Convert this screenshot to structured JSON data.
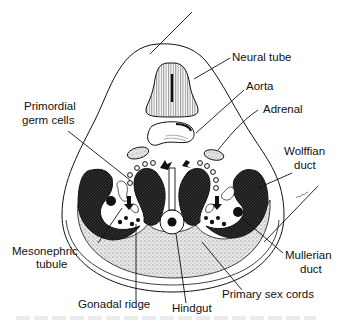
{
  "diagram": {
    "labels": {
      "neural_tube": "Neural tube",
      "aorta": "Aorta",
      "adrenal": "Adrenal",
      "primordial_germ_cells_1": "Primordial",
      "primordial_germ_cells_2": "germ cells",
      "wolffian_duct_1": "Wolffian",
      "wolffian_duct_2": "duct",
      "mesonephric_tubule_1": "Mesonephric",
      "mesonephric_tubule_2": "tubule",
      "mullerian_duct_1": "Mullerian",
      "mullerian_duct_2": "duct",
      "primary_sex_cords": "Primary sex cords",
      "gonadal_ridge": "Gonadal ridge",
      "hindgut": "Hindgut"
    }
  }
}
